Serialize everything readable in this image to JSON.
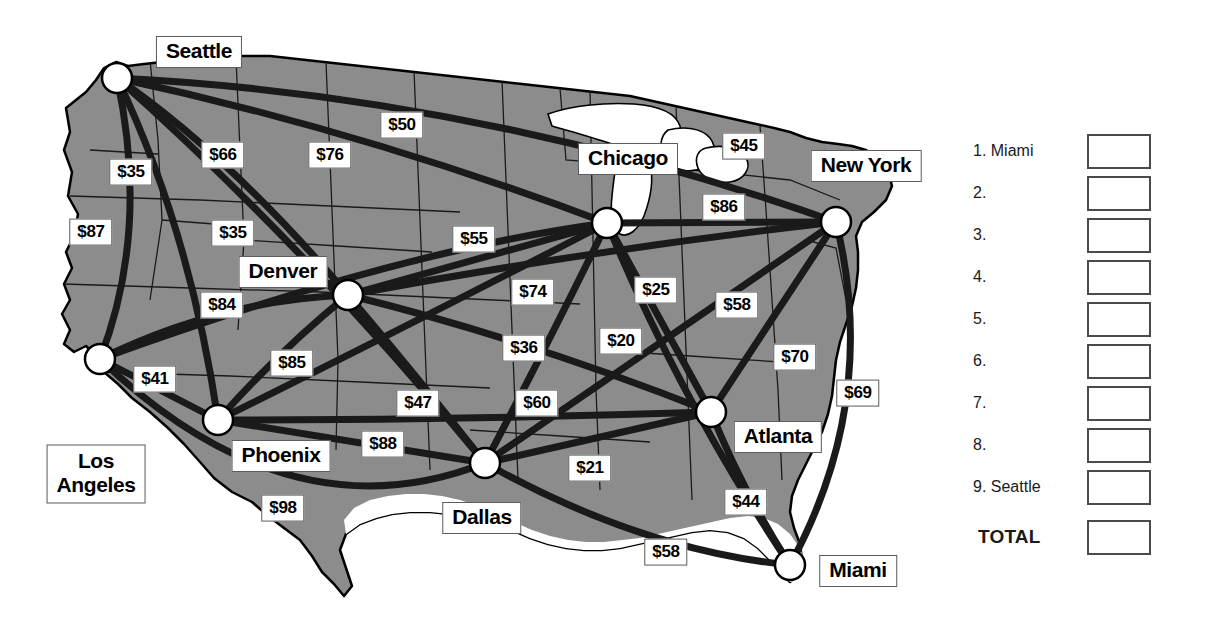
{
  "map": {
    "title": "United States airfare route map",
    "background_color": "#ffffff",
    "land_fill": "#8c8c8c",
    "land_stroke": "#000000",
    "route_color": "#1a1a1a",
    "node_fill": "#ffffff",
    "node_stroke": "#000000",
    "cities": [
      {
        "id": "seattle",
        "name": "Seattle",
        "x": 117,
        "y": 78,
        "label_x": 199,
        "label_y": 52,
        "two_line": false
      },
      {
        "id": "los-angeles",
        "name": "Los Angeles",
        "x": 100,
        "y": 359,
        "label_x": 96,
        "label_y": 474,
        "two_line": true,
        "line1": "Los",
        "line2": "Angeles"
      },
      {
        "id": "phoenix",
        "name": "Phoenix",
        "x": 218,
        "y": 420,
        "label_x": 281,
        "label_y": 456,
        "two_line": false
      },
      {
        "id": "denver",
        "name": "Denver",
        "x": 348,
        "y": 295,
        "label_x": 283,
        "label_y": 272,
        "two_line": false
      },
      {
        "id": "dallas",
        "name": "Dallas",
        "x": 485,
        "y": 463,
        "label_x": 482,
        "label_y": 518,
        "two_line": false
      },
      {
        "id": "chicago",
        "name": "Chicago",
        "x": 607,
        "y": 223,
        "label_x": 628,
        "label_y": 159,
        "two_line": false
      },
      {
        "id": "atlanta",
        "name": "Atlanta",
        "x": 711,
        "y": 412,
        "label_x": 778,
        "label_y": 437,
        "two_line": false
      },
      {
        "id": "new-york",
        "name": "New York",
        "x": 836,
        "y": 222,
        "label_x": 866,
        "label_y": 166,
        "two_line": false
      },
      {
        "id": "miami",
        "name": "Miami",
        "x": 790,
        "y": 565,
        "label_x": 858,
        "label_y": 571,
        "two_line": false
      }
    ],
    "prices": [
      {
        "id": "p-seattle-denver",
        "value": "$35",
        "x": 131,
        "y": 172
      },
      {
        "id": "p-seattle-la",
        "value": "$87",
        "x": 91,
        "y": 232
      },
      {
        "id": "p-seattle-phoenix",
        "value": "$66",
        "x": 223,
        "y": 155
      },
      {
        "id": "p-seattle-dallas",
        "value": "$76",
        "x": 330,
        "y": 155
      },
      {
        "id": "p-seattle-chicago",
        "value": "$50",
        "x": 402,
        "y": 125
      },
      {
        "id": "p-chicago-newyork",
        "value": "$45",
        "x": 744,
        "y": 146
      },
      {
        "id": "p-denver-seattle-alt",
        "value": "$35",
        "x": 233,
        "y": 233
      },
      {
        "id": "p-chicago-denver",
        "value": "$55",
        "x": 474,
        "y": 239
      },
      {
        "id": "p-newyork-chicago-alt",
        "value": "$86",
        "x": 724,
        "y": 207
      },
      {
        "id": "p-denver-phoenix",
        "value": "$84",
        "x": 222,
        "y": 305
      },
      {
        "id": "p-dallas-chicago",
        "value": "$74",
        "x": 533,
        "y": 292
      },
      {
        "id": "p-chicago-atlanta",
        "value": "$25",
        "x": 656,
        "y": 290
      },
      {
        "id": "p-newyork-atlanta",
        "value": "$58",
        "x": 737,
        "y": 305
      },
      {
        "id": "p-phoenix-dallas",
        "value": "$85",
        "x": 292,
        "y": 363
      },
      {
        "id": "p-la-phoenix",
        "value": "$41",
        "x": 155,
        "y": 379
      },
      {
        "id": "p-dallas-denver",
        "value": "$36",
        "x": 524,
        "y": 348
      },
      {
        "id": "p-chicago-miami",
        "value": "$20",
        "x": 621,
        "y": 341
      },
      {
        "id": "p-atlanta-newyork-alt",
        "value": "$70",
        "x": 795,
        "y": 357
      },
      {
        "id": "p-miami-newyork",
        "value": "$69",
        "x": 858,
        "y": 393
      },
      {
        "id": "p-dallas-phoenix-alt",
        "value": "$47",
        "x": 418,
        "y": 403
      },
      {
        "id": "p-dallas-chicago-alt",
        "value": "$60",
        "x": 537,
        "y": 403
      },
      {
        "id": "p-phoenix-dallas-alt",
        "value": "$88",
        "x": 383,
        "y": 444
      },
      {
        "id": "p-dallas-atlanta",
        "value": "$21",
        "x": 590,
        "y": 468
      },
      {
        "id": "p-atlanta-miami",
        "value": "$44",
        "x": 746,
        "y": 502
      },
      {
        "id": "p-la-dallas",
        "value": "$98",
        "x": 283,
        "y": 508
      },
      {
        "id": "p-dallas-miami",
        "value": "$58",
        "x": 666,
        "y": 552
      }
    ]
  },
  "worksheet": {
    "rows": [
      {
        "num": "1.",
        "city": "Miami",
        "label": "1.  Miami"
      },
      {
        "num": "2.",
        "city": "",
        "label": "2."
      },
      {
        "num": "3.",
        "city": "",
        "label": "3."
      },
      {
        "num": "4.",
        "city": "",
        "label": "4."
      },
      {
        "num": "5.",
        "city": "",
        "label": "5."
      },
      {
        "num": "6.",
        "city": "",
        "label": "6."
      },
      {
        "num": "7.",
        "city": "",
        "label": "7."
      },
      {
        "num": "8.",
        "city": "",
        "label": "8."
      },
      {
        "num": "9.",
        "city": "Seattle",
        "label": "9.  Seattle"
      }
    ],
    "total_label": "TOTAL"
  }
}
